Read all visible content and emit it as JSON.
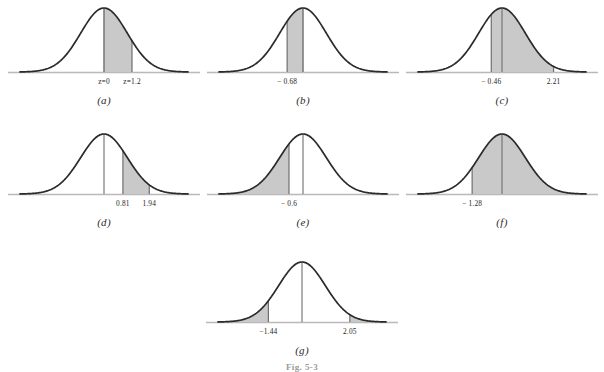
{
  "figure": {
    "caption": "Fig. 5-3",
    "shade_color": "#c9c9c9",
    "curve_color": "#2b2b2b",
    "axis_color": "#b9b9b9",
    "rule_color": "#6f6f6f"
  },
  "chart_data": {
    "type": "area",
    "xlabel": "z",
    "ylabel": "",
    "grid": false,
    "legend": "none",
    "xlim": [
      -3.6,
      3.6
    ],
    "distribution": "standard normal (mean 0, sd 1)",
    "panels": [
      {
        "id": "a",
        "label": "(a)",
        "boundaries": [
          0,
          1.2
        ],
        "tick_labels": [
          "z=0",
          "z=1.2"
        ],
        "shade_from": 0,
        "shade_to": 1.2,
        "shade_mode": "between",
        "center_rule": false
      },
      {
        "id": "b",
        "label": "(b)",
        "boundaries": [
          -0.68,
          0
        ],
        "tick_labels": [
          "− 0.68"
        ],
        "shade_from": -0.68,
        "shade_to": 0,
        "shade_mode": "between",
        "center_rule": false
      },
      {
        "id": "c",
        "label": "(c)",
        "boundaries": [
          -0.46,
          2.21
        ],
        "tick_labels": [
          "− 0.46",
          "2.21"
        ],
        "shade_from": -0.46,
        "shade_to": 2.21,
        "shade_mode": "between",
        "center_rule": true
      },
      {
        "id": "d",
        "label": "(d)",
        "boundaries": [
          0.81,
          1.94
        ],
        "tick_labels": [
          "0.81",
          "1.94"
        ],
        "shade_from": 0.81,
        "shade_to": 1.94,
        "shade_mode": "between",
        "center_rule": true
      },
      {
        "id": "e",
        "label": "(e)",
        "boundaries": [
          -0.6
        ],
        "tick_labels": [
          "− 0.6"
        ],
        "shade_from": -3.6,
        "shade_to": -0.6,
        "shade_mode": "left-tail",
        "center_rule": true
      },
      {
        "id": "f",
        "label": "(f)",
        "boundaries": [
          -1.28
        ],
        "tick_labels": [
          "− 1.28"
        ],
        "shade_from": -1.28,
        "shade_to": 3.6,
        "shade_mode": "right-tail",
        "center_rule": true
      },
      {
        "id": "g",
        "label": "(g)",
        "boundaries": [
          -1.44,
          2.05
        ],
        "tick_labels": [
          "−1.44",
          "2.05"
        ],
        "shade_from": -3.6,
        "shade_to": 2.05,
        "shade_mode": "two-tails",
        "center_rule": true
      }
    ]
  }
}
